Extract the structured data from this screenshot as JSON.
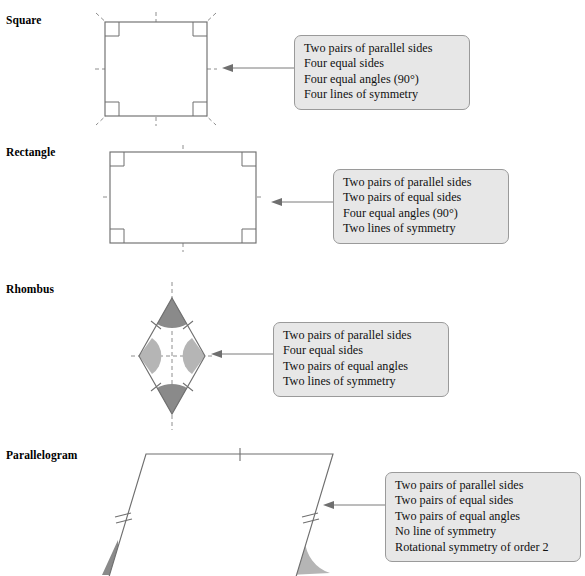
{
  "page": {
    "background": "#ffffff",
    "callout_fill": "#e7e7e7",
    "callout_border": "#9a9a9a",
    "shape_stroke": "#6f6f6f",
    "dash_stroke": "#8e8e8e",
    "angle_arc_dark": "#8a8a8a",
    "angle_arc_light": "#b5b5b5"
  },
  "shapes": [
    {
      "id": "square",
      "label": "Square",
      "properties": [
        "Two pairs of parallel sides",
        "Four equal sides",
        "Four equal angles (90°)",
        "Four lines of symmetry"
      ]
    },
    {
      "id": "rectangle",
      "label": "Rectangle",
      "properties": [
        "Two pairs of parallel sides",
        "Two pairs of equal sides",
        "Four equal angles (90°)",
        "Two lines of symmetry"
      ]
    },
    {
      "id": "rhombus",
      "label": "Rhombus",
      "properties": [
        "Two pairs of parallel sides",
        "Four equal sides",
        "Two pairs of equal angles",
        "Two lines of symmetry"
      ]
    },
    {
      "id": "parallelogram",
      "label": "Parallelogram",
      "properties": [
        "Two pairs of parallel sides",
        "Two pairs of equal sides",
        "Two pairs of equal angles",
        "No line of symmetry",
        "Rotational symmetry of order 2"
      ]
    }
  ]
}
